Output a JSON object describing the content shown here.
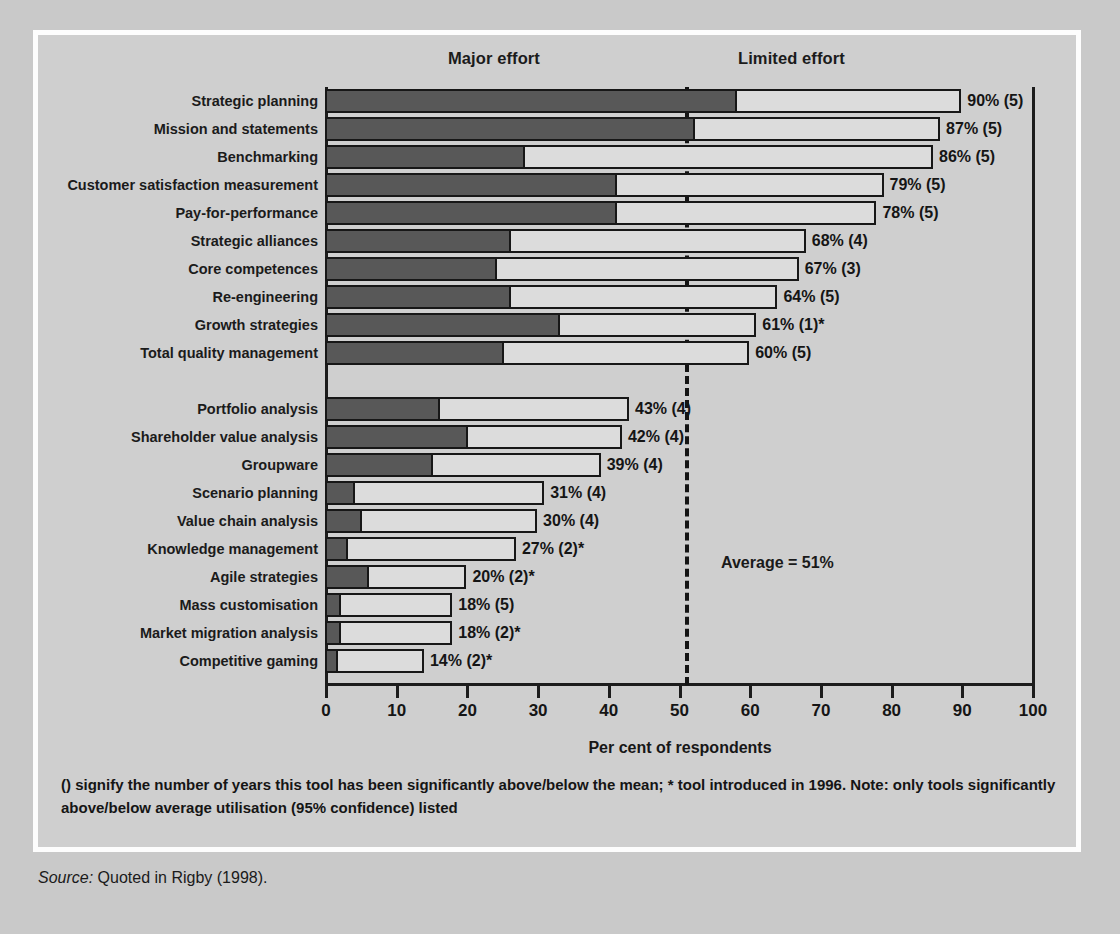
{
  "headers": {
    "major": "Major effort",
    "limited": "Limited effort"
  },
  "annotation": {
    "average": "Average = 51%"
  },
  "axis": {
    "title": "Per cent of respondents",
    "ticks": [
      "0",
      "10",
      "20",
      "30",
      "40",
      "50",
      "60",
      "70",
      "80",
      "90",
      "100"
    ]
  },
  "footnote": "() signify the number of years this tool has been significantly above/below the mean; * tool introduced in 1996. Note: only tools significantly above/below average utilisation (95% confidence) listed",
  "source": {
    "lead": "Source:",
    "text": " Quoted in Rigby (1998)."
  },
  "colors": {
    "major_effort": "#585858",
    "limited_effort": "#dcdcdc",
    "outline": "#171717",
    "background": "#cfcfcf",
    "frame": "#fdfdfd",
    "average_line": "#141414"
  },
  "chart_data": {
    "type": "bar",
    "orientation": "horizontal",
    "stacked": true,
    "title": "",
    "xlabel": "Per cent of respondents",
    "ylabel": "",
    "xlim": [
      0,
      100
    ],
    "xticks": [
      0,
      10,
      20,
      30,
      40,
      50,
      60,
      70,
      80,
      90,
      100
    ],
    "grid": false,
    "legend": [
      "Major effort",
      "Limited effort"
    ],
    "legend_position": "top",
    "average_line_value": 51,
    "average_label": "Average = 51%",
    "categories": [
      "Strategic planning",
      "Mission and statements",
      "Benchmarking",
      "Customer satisfaction measurement",
      "Pay-for-performance",
      "Strategic alliances",
      "Core competences",
      "Re-engineering",
      "Growth strategies",
      "Total quality management",
      "Portfolio analysis",
      "Shareholder value analysis",
      "Groupware",
      "Scenario planning",
      "Value chain analysis",
      "Knowledge management",
      "Agile strategies",
      "Mass customisation",
      "Market migration analysis",
      "Competitive gaming"
    ],
    "series": [
      {
        "name": "Major effort",
        "values": [
          58,
          52,
          28,
          41,
          41,
          26,
          24,
          26,
          33,
          25,
          16,
          20,
          15,
          4,
          5,
          3,
          6,
          2,
          2,
          1.5
        ]
      },
      {
        "name": "Limited effort",
        "values": [
          32,
          35,
          58,
          38,
          37,
          42,
          43,
          38,
          28,
          35,
          27,
          22,
          24,
          27,
          25,
          24,
          14,
          16,
          16,
          12.5
        ]
      }
    ],
    "totals": [
      90,
      87,
      86,
      79,
      78,
      68,
      67,
      64,
      61,
      60,
      43,
      42,
      39,
      31,
      30,
      27,
      20,
      18,
      18,
      14
    ],
    "data_labels": [
      "90% (5)",
      "87% (5)",
      "86% (5)",
      "79% (5)",
      "78% (5)",
      "68% (4)",
      "67% (3)",
      "64% (5)",
      "61% (1)*",
      "60% (5)",
      "43%  (4)",
      "42% (4)",
      "39% (4)",
      "31% (4)",
      "30% (4)",
      "27% (2)*",
      "20% (2)*",
      "18% (5)",
      "18% (2)*",
      "14% (2)*"
    ],
    "group_break_after_index": 9
  }
}
